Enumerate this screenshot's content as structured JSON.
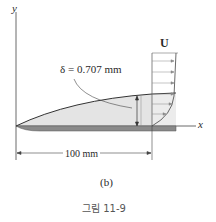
{
  "figure": {
    "axes": {
      "y_label": "y",
      "x_label": "x"
    },
    "free_stream_label": "U",
    "boundary_layer_thickness_label": "δ = 0.707 mm",
    "length_dimension_label": "100 mm",
    "subfigure_label": "(b)",
    "caption": "그림 11-9"
  },
  "colors": {
    "line": "#3a3a3a",
    "plate": "#8a8a8a",
    "boundary_layer_fill": "#e4e4e4",
    "profile_fill": "#ececec"
  }
}
